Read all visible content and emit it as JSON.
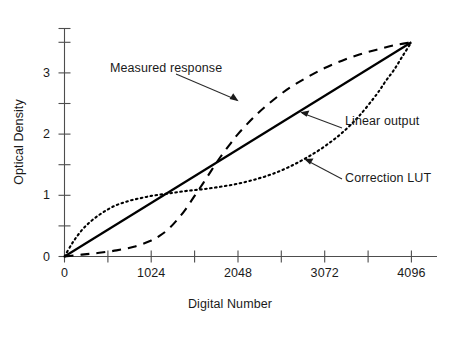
{
  "chart_data": {
    "type": "line",
    "title": "",
    "subtitle": "",
    "xlabel": "Digital Number",
    "ylabel": "Optical Density",
    "xlim": [
      0,
      4380
    ],
    "ylim": [
      0,
      3.73
    ],
    "grid": false,
    "legend_position": "inline-annotations",
    "x_ticks": [
      0,
      512,
      1024,
      1536,
      2048,
      2560,
      3072,
      3584,
      4096
    ],
    "x_tick_labels": [
      "0",
      "",
      "1024",
      "",
      "2048",
      "",
      "3072",
      "",
      "4096"
    ],
    "y_ticks": [
      0,
      0.5,
      1,
      1.5,
      2,
      2.5,
      3,
      3.5
    ],
    "y_tick_labels": [
      "0",
      "",
      "1",
      "",
      "2",
      "",
      "3",
      ""
    ],
    "series": [
      {
        "name": "Measured response",
        "style": "dashed",
        "color": "#000000",
        "x": [
          0,
          205,
          410,
          614,
          819,
          1024,
          1126,
          1229,
          1331,
          1434,
          1536,
          1638,
          1741,
          1843,
          1946,
          2048,
          2253,
          2458,
          2662,
          2867,
          3072,
          3277,
          3482,
          3686,
          3891,
          4096
        ],
        "y": [
          0.0,
          0.03,
          0.06,
          0.1,
          0.16,
          0.26,
          0.34,
          0.45,
          0.6,
          0.78,
          0.99,
          1.2,
          1.42,
          1.63,
          1.82,
          2.0,
          2.3,
          2.55,
          2.76,
          2.93,
          3.08,
          3.2,
          3.3,
          3.38,
          3.45,
          3.5
        ]
      },
      {
        "name": "Linear output",
        "style": "solid",
        "color": "#000000",
        "x": [
          0,
          4096
        ],
        "y": [
          0.0,
          3.5
        ]
      },
      {
        "name": "Correction LUT",
        "style": "dotted",
        "color": "#000000",
        "x": [
          0,
          102,
          205,
          307,
          410,
          512,
          614,
          717,
          819,
          922,
          1024,
          1229,
          1434,
          1638,
          1843,
          2048,
          2253,
          2458,
          2662,
          2867,
          3072,
          3277,
          3482,
          3686,
          3789,
          3891,
          3994,
          4096
        ],
        "y": [
          0.0,
          0.24,
          0.43,
          0.57,
          0.68,
          0.77,
          0.84,
          0.89,
          0.93,
          0.96,
          0.99,
          1.03,
          1.07,
          1.1,
          1.14,
          1.19,
          1.26,
          1.35,
          1.47,
          1.62,
          1.8,
          2.02,
          2.3,
          2.65,
          2.86,
          3.05,
          3.28,
          3.5
        ]
      }
    ],
    "annotations": [
      {
        "text": "Measured response",
        "points_to_series": "Measured response"
      },
      {
        "text": "Linear output",
        "points_to_series": "Linear output"
      },
      {
        "text": "Correction LUT",
        "points_to_series": "Correction LUT"
      }
    ]
  },
  "axes": {
    "x_title": "Digital Number",
    "y_title": "Optical Density",
    "x_tick_labels": [
      {
        "value": 0,
        "label": "0"
      },
      {
        "value": 1024,
        "label": "1024"
      },
      {
        "value": 2048,
        "label": "2048"
      },
      {
        "value": 3072,
        "label": "3072"
      },
      {
        "value": 4096,
        "label": "4096"
      }
    ],
    "y_tick_labels": [
      {
        "value": 0,
        "label": "0"
      },
      {
        "value": 1,
        "label": "1"
      },
      {
        "value": 2,
        "label": "2"
      },
      {
        "value": 3,
        "label": "3"
      }
    ]
  },
  "labels": {
    "measured": "Measured response",
    "linear": "Linear output",
    "lut": "Correction LUT"
  },
  "colors": {
    "axis": "#4d4d4d",
    "curve": "#000000",
    "text": "#1a1a1a",
    "background": "#ffffff"
  }
}
